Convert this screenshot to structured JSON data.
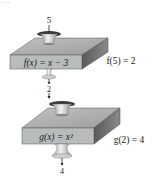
{
  "header": {
    "cut_off_text": "…"
  },
  "machines": [
    {
      "name": "f",
      "input_value": "5",
      "rule_label": "f(x) = x − 3",
      "result_label": "f(5) = 2",
      "output_value": "2"
    },
    {
      "name": "g",
      "input_value": "2",
      "rule_label": "g(x) = x²",
      "result_label": "g(2) = 4",
      "output_value": "4"
    }
  ],
  "colors": {
    "top_face": "#a9a9a9",
    "front_face": "#b8bcbc",
    "side_face": "#6e6e6e",
    "funnel": "#d9d9d9",
    "funnel_dark": "#3a3a3a",
    "text": "#222222"
  }
}
